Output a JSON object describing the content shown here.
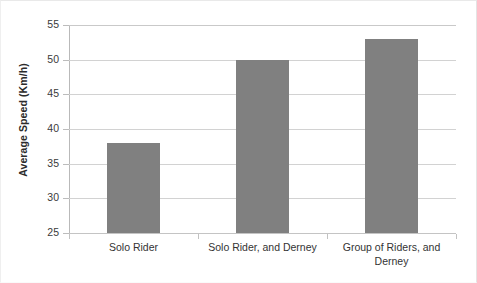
{
  "chart_data": {
    "type": "bar",
    "title": "",
    "xlabel": "",
    "ylabel": "Average Speed (Km/h)",
    "categories": [
      "Solo Rider",
      "Solo Rider, and Derney",
      "Group of Riders, and Derney"
    ],
    "values": [
      38,
      50,
      53
    ],
    "series": [
      {
        "name": "Average Speed",
        "values": [
          38,
          50,
          53
        ]
      }
    ],
    "ylim": [
      25,
      55
    ],
    "ytick_labels": [
      "55",
      "50",
      "45",
      "40",
      "35",
      "30",
      "25"
    ],
    "ytick_values": [
      55,
      50,
      45,
      40,
      35,
      30,
      25
    ],
    "grid": true,
    "legend": "none",
    "bar_color": "#808080",
    "gridline_color": "#d2d2d2",
    "axis_color": "#bcbcbc",
    "text_color": "#333333"
  }
}
